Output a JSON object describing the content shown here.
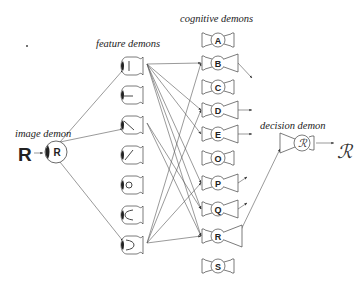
{
  "labels": {
    "image_demon": "image demon",
    "feature_demons": "feature demons",
    "cognitive_demons": "cognitive demons",
    "decision_demon": "decision demon"
  },
  "input_letter": "R",
  "image_demon_letter": "R",
  "decision_demon_letter": "ℛ",
  "output_letter": "ℛ",
  "feature_demons": [
    {
      "feature": "vertical-line"
    },
    {
      "feature": "horizontal-line"
    },
    {
      "feature": "diagonal-backslash"
    },
    {
      "feature": "diagonal-slash"
    },
    {
      "feature": "circle"
    },
    {
      "feature": "open-curve-left"
    },
    {
      "feature": "open-curve-right"
    }
  ],
  "cognitive_demons": [
    {
      "letter": "A",
      "shouting": 0
    },
    {
      "letter": "B",
      "shouting": 1
    },
    {
      "letter": "C",
      "shouting": 0
    },
    {
      "letter": "D",
      "shouting": 1
    },
    {
      "letter": "E",
      "shouting": 1
    },
    {
      "letter": "O",
      "shouting": 0
    },
    {
      "letter": "P",
      "shouting": 1
    },
    {
      "letter": "Q",
      "shouting": 1
    },
    {
      "letter": "R",
      "shouting": 2
    },
    {
      "letter": "S",
      "shouting": 0
    }
  ],
  "connections": {
    "image_to_features": [
      0,
      2,
      6
    ],
    "features_to_cognitive": [
      {
        "from": 0,
        "to": 1
      },
      {
        "from": 0,
        "to": 3
      },
      {
        "from": 0,
        "to": 4
      },
      {
        "from": 0,
        "to": 6
      },
      {
        "from": 0,
        "to": 7
      },
      {
        "from": 0,
        "to": 8
      },
      {
        "from": 2,
        "to": 7
      },
      {
        "from": 2,
        "to": 8
      },
      {
        "from": 6,
        "to": 1
      },
      {
        "from": 6,
        "to": 3
      },
      {
        "from": 6,
        "to": 6
      },
      {
        "from": 6,
        "to": 8
      }
    ],
    "cognitive_to_decision": [
      8
    ]
  }
}
